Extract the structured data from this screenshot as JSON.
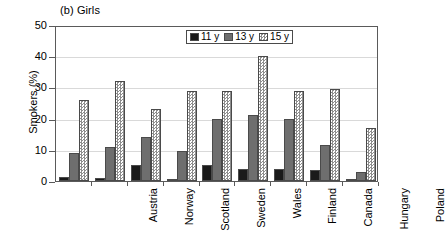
{
  "chart_data": {
    "type": "bar",
    "title": "(b) Girls",
    "xlabel": "",
    "ylabel": "Smokers (%)",
    "ylim": [
      0,
      50
    ],
    "yticks": [
      0,
      10,
      20,
      30,
      40,
      50
    ],
    "grid": true,
    "legend_position": "top-right-inside",
    "categories": [
      "Austria",
      "Norway",
      "Scotland",
      "Sweden",
      "Wales",
      "Finland",
      "Canada",
      "Hungary",
      "Poland"
    ],
    "series": [
      {
        "name": "11 y",
        "color": "#1a1a1a",
        "values": [
          1.3,
          1.0,
          5.2,
          0.8,
          5.0,
          3.8,
          4.0,
          3.5,
          0.7
        ]
      },
      {
        "name": "13 y",
        "color": "#6e6e6e",
        "values": [
          9.0,
          11.0,
          14.0,
          9.5,
          20.0,
          21.0,
          20.0,
          11.5,
          3.0
        ]
      },
      {
        "name": "15 y",
        "color": "#8e8e8e",
        "values": [
          26.0,
          32.0,
          23.0,
          29.0,
          29.0,
          40.0,
          29.0,
          29.5,
          17.0
        ]
      }
    ]
  },
  "legend": {
    "items": [
      {
        "label": "11 y"
      },
      {
        "label": "13 y"
      },
      {
        "label": "15 y"
      }
    ]
  }
}
